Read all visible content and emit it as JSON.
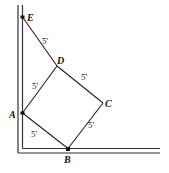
{
  "diagram": {
    "points": {
      "E": {
        "label": "E",
        "x": 22,
        "y": 17
      },
      "D": {
        "label": "D",
        "x": 57,
        "y": 66
      },
      "C": {
        "label": "C",
        "x": 103,
        "y": 103
      },
      "A": {
        "label": "A",
        "x": 22,
        "y": 115
      },
      "B": {
        "label": "B",
        "x": 68,
        "y": 150
      }
    },
    "segments": [
      {
        "from": "E",
        "to": "D",
        "length_label": "5′"
      },
      {
        "from": "D",
        "to": "C",
        "length_label": "5′"
      },
      {
        "from": "A",
        "to": "D",
        "length_label": "5′"
      },
      {
        "from": "A",
        "to": "B",
        "length_label": "5′"
      },
      {
        "from": "B",
        "to": "C",
        "length_label": "5′"
      }
    ],
    "walls": {
      "vertical": "wall",
      "horizontal": "floor"
    }
  }
}
